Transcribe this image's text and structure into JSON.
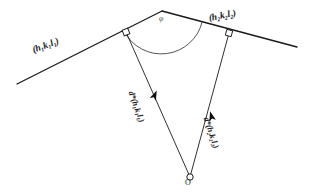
{
  "figure": {
    "background_color": "#ffffff",
    "ink_color": "#1a1a1a",
    "labels": {
      "plane1": "(h₁k₁l₁)",
      "plane2": "(h₂k₂l₂)",
      "dstar1": "d*(h₁k₁l₁)",
      "dstar2": "d*(h₂k₂l₂)",
      "origin": "O",
      "angle": "φ"
    },
    "geometry": {
      "apex": [
        162,
        11
      ],
      "origin": [
        190,
        177
      ],
      "plane1_start": [
        17,
        84
      ],
      "plane1_end": [
        162,
        11
      ],
      "plane2_start": [
        162,
        11
      ],
      "plane2_end": [
        297,
        47
      ],
      "foot1": [
        126,
        32
      ],
      "foot2": [
        229,
        33
      ],
      "angle_arc_radius": 42
    },
    "markers": {
      "right_angle_1": "right-angle-square",
      "right_angle_2": "right-angle-square",
      "arrow_1": "vector-arrowhead",
      "arrow_2": "vector-arrowhead",
      "origin_marker": "open-circle"
    }
  }
}
